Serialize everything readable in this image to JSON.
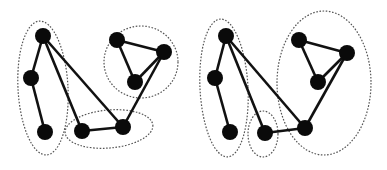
{
  "figure": {
    "colors": {
      "node": "#0a0a0a",
      "edge": "#111111",
      "cluster_outline": "#555555",
      "background": "#ffffff"
    },
    "panels": [
      {
        "id": "left",
        "nodes": [
          {
            "id": "a",
            "x": 43,
            "y": 36
          },
          {
            "id": "b",
            "x": 31,
            "y": 78
          },
          {
            "id": "c",
            "x": 45,
            "y": 132
          },
          {
            "id": "d",
            "x": 82,
            "y": 131
          },
          {
            "id": "e",
            "x": 123,
            "y": 127
          },
          {
            "id": "f",
            "x": 117,
            "y": 40
          },
          {
            "id": "g",
            "x": 164,
            "y": 52
          },
          {
            "id": "h",
            "x": 135,
            "y": 82
          }
        ],
        "edges": [
          [
            "a",
            "b"
          ],
          [
            "b",
            "c"
          ],
          [
            "a",
            "d"
          ],
          [
            "a",
            "e"
          ],
          [
            "d",
            "e"
          ],
          [
            "e",
            "g"
          ],
          [
            "f",
            "g"
          ],
          [
            "f",
            "h"
          ],
          [
            "h",
            "g"
          ]
        ],
        "clusters": [
          {
            "cx": 43,
            "cy": 88,
            "rx": 25,
            "ry": 67,
            "rot": -3
          },
          {
            "cx": 109,
            "cy": 129,
            "rx": 44,
            "ry": 19,
            "rot": -5
          },
          {
            "cx": 141,
            "cy": 62,
            "rx": 37,
            "ry": 36,
            "rot": 0
          }
        ]
      },
      {
        "id": "right",
        "nodes": [
          {
            "id": "a",
            "x": 226,
            "y": 36
          },
          {
            "id": "b",
            "x": 215,
            "y": 78
          },
          {
            "id": "c",
            "x": 230,
            "y": 132
          },
          {
            "id": "d",
            "x": 265,
            "y": 133
          },
          {
            "id": "e",
            "x": 305,
            "y": 128
          },
          {
            "id": "f",
            "x": 299,
            "y": 40
          },
          {
            "id": "g",
            "x": 347,
            "y": 53
          },
          {
            "id": "h",
            "x": 318,
            "y": 82
          }
        ],
        "edges": [
          [
            "a",
            "b"
          ],
          [
            "b",
            "c"
          ],
          [
            "a",
            "d"
          ],
          [
            "a",
            "e"
          ],
          [
            "d",
            "e"
          ],
          [
            "e",
            "g"
          ],
          [
            "f",
            "g"
          ],
          [
            "f",
            "h"
          ],
          [
            "h",
            "g"
          ]
        ],
        "clusters": [
          {
            "cx": 224,
            "cy": 88,
            "rx": 24,
            "ry": 69,
            "rot": -3
          },
          {
            "cx": 263,
            "cy": 134,
            "rx": 15,
            "ry": 23,
            "rot": 0
          },
          {
            "cx": 324,
            "cy": 83,
            "rx": 47,
            "ry": 72,
            "rot": 0
          }
        ]
      }
    ]
  }
}
